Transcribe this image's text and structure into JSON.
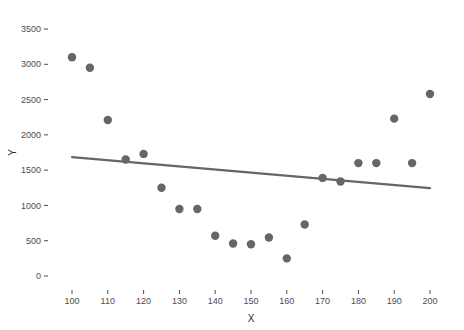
{
  "chart_data": {
    "type": "scatter",
    "title": "",
    "subtitle": "",
    "xlabel": "X",
    "ylabel": "Y",
    "xlim": [
      96,
      204
    ],
    "ylim": [
      -180,
      3680
    ],
    "xticks": [
      100,
      110,
      120,
      130,
      140,
      150,
      160,
      170,
      180,
      190,
      200
    ],
    "yticks": [
      0,
      500,
      1000,
      1500,
      2000,
      2500,
      3000,
      3500
    ],
    "xtick_labels": [
      "100",
      "110",
      "120",
      "130",
      "140",
      "150",
      "160",
      "170",
      "180",
      "190",
      "200"
    ],
    "ytick_labels": [
      "0",
      "500",
      "1000",
      "1500",
      "2000",
      "2500",
      "3000",
      "3500"
    ],
    "grid": false,
    "legend": "none",
    "point_color": "#666666",
    "line_color": "#666666",
    "background_color": "#ffffff",
    "axis_text_color": "#4d4d4d",
    "point_radius": 4.2,
    "x": [
      100,
      105,
      110,
      115,
      120,
      125,
      130,
      135,
      140,
      145,
      150,
      155,
      160,
      165,
      170,
      175,
      180,
      185,
      190,
      195,
      200
    ],
    "y": [
      3100,
      2950,
      2210,
      1650,
      1730,
      1250,
      950,
      950,
      570,
      460,
      450,
      545,
      250,
      730,
      1390,
      1340,
      1600,
      1600,
      2230,
      1600,
      2580
    ],
    "series": [
      {
        "name": "observations",
        "type": "scatter",
        "points": [
          {
            "x": 100,
            "y": 3100
          },
          {
            "x": 105,
            "y": 2950
          },
          {
            "x": 110,
            "y": 2210
          },
          {
            "x": 115,
            "y": 1650
          },
          {
            "x": 120,
            "y": 1730
          },
          {
            "x": 125,
            "y": 1250
          },
          {
            "x": 130,
            "y": 950
          },
          {
            "x": 135,
            "y": 950
          },
          {
            "x": 140,
            "y": 570
          },
          {
            "x": 145,
            "y": 460
          },
          {
            "x": 150,
            "y": 450
          },
          {
            "x": 155,
            "y": 545
          },
          {
            "x": 160,
            "y": 250
          },
          {
            "x": 165,
            "y": 730
          },
          {
            "x": 170,
            "y": 1390
          },
          {
            "x": 175,
            "y": 1340
          },
          {
            "x": 180,
            "y": 1600
          },
          {
            "x": 185,
            "y": 1600
          },
          {
            "x": 190,
            "y": 2230
          },
          {
            "x": 195,
            "y": 1600
          },
          {
            "x": 200,
            "y": 2580
          }
        ]
      },
      {
        "name": "fit-line",
        "type": "line",
        "points": [
          {
            "x": 100,
            "y": 1685
          },
          {
            "x": 200,
            "y": 1245
          }
        ]
      }
    ]
  }
}
